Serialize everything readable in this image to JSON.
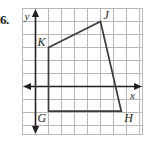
{
  "problem": {
    "number": "6."
  },
  "figure": {
    "type": "coordinate-grid-quadrilateral",
    "axes": {
      "x_label": "x",
      "y_label": "y",
      "x_axis_row": 6,
      "y_axis_col": 1
    },
    "grid": {
      "cols": 9,
      "rows": 10,
      "cell_px": 13,
      "line_color": "#b9b6b4",
      "border_color": "#b9b6b4"
    },
    "colors": {
      "axis": "#231f20",
      "shape_stroke": "#3b3a3c",
      "label_text": "#231f20",
      "background": "#ffffff"
    },
    "vertices": [
      {
        "name": "K",
        "grid_x": 2,
        "grid_y": 3,
        "label_dx": -11,
        "label_dy": -2
      },
      {
        "name": "J",
        "grid_x": 6,
        "grid_y": 1,
        "label_dx": 3,
        "label_dy": -3
      },
      {
        "name": "H",
        "grid_x": 7.6,
        "grid_y": 7.9,
        "label_dx": 3,
        "label_dy": 11
      },
      {
        "name": "G",
        "grid_x": 2,
        "grid_y": 7.9,
        "label_dx": -11,
        "label_dy": 11
      }
    ],
    "shape_name": "GHJK",
    "edges": [
      "K-J",
      "J-H",
      "H-G",
      "G-K"
    ]
  }
}
